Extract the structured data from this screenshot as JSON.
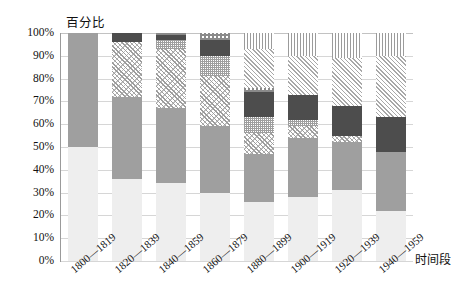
{
  "chart_data": {
    "type": "bar",
    "title": "",
    "subtitle": "",
    "ylabel": "百分比",
    "xlabel": "时间段",
    "stacked": true,
    "grid": true,
    "legend_position": "none",
    "ylim": [
      0,
      100
    ],
    "ytick_labels": [
      "100%",
      "90%",
      "80%",
      "70%",
      "60%",
      "50%",
      "40%",
      "30%",
      "20%",
      "10%",
      "0%"
    ],
    "ytick_values": [
      100,
      90,
      80,
      70,
      60,
      50,
      40,
      30,
      20,
      10,
      0
    ],
    "categories": [
      "1800—1819",
      "1820—1839",
      "1840—1859",
      "1860—1879",
      "1880—1899",
      "1900—1919",
      "1920—1939",
      "1940—1959"
    ],
    "series": [
      {
        "name": "series-1",
        "pattern": "light-gray-solid",
        "values": [
          50,
          36,
          34,
          30,
          26,
          28,
          31,
          22
        ]
      },
      {
        "name": "series-2",
        "pattern": "medium-gray-solid",
        "values": [
          50,
          36,
          33,
          29,
          21,
          26,
          21,
          26
        ]
      },
      {
        "name": "series-3",
        "pattern": "diagonal-hatch",
        "values": [
          0,
          24,
          26,
          22,
          9,
          5,
          3,
          0
        ]
      },
      {
        "name": "series-4",
        "pattern": "fine-dots",
        "values": [
          0,
          0,
          4,
          9,
          7,
          3,
          0,
          0
        ]
      },
      {
        "name": "series-5",
        "pattern": "dark-gray-solid",
        "values": [
          0,
          4,
          2,
          7,
          11,
          11,
          13,
          15
        ]
      },
      {
        "name": "series-6",
        "pattern": "coarse-checker",
        "values": [
          0,
          0,
          1,
          3,
          2,
          0,
          0,
          0
        ]
      },
      {
        "name": "series-7",
        "pattern": "light-diagonal-hatch",
        "values": [
          0,
          0,
          0,
          0,
          17,
          17,
          21,
          27
        ]
      },
      {
        "name": "series-8",
        "pattern": "vertical-lines",
        "values": [
          0,
          0,
          0,
          0,
          7,
          10,
          11,
          10
        ]
      }
    ]
  },
  "footer": {
    "cropped_text": ""
  }
}
